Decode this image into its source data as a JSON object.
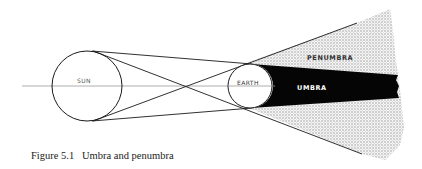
{
  "figure": {
    "caption": "Figure 5.1   Umbra and penumbra",
    "labels": {
      "sun": "SUN",
      "earth": "EARTH",
      "umbra": "UMBRA",
      "penumbra": "PENUMBRA"
    },
    "colors": {
      "line": "#1a1a1a",
      "axis": "#9a9a9a",
      "umbra": "#050505",
      "penumbra_dot": "#9c9c9c",
      "background": "#ffffff"
    },
    "geometry": {
      "sun": {
        "cx": 87,
        "cy": 86,
        "r": 35
      },
      "earth": {
        "cx": 250,
        "cy": 86,
        "r": 22
      },
      "axis": {
        "x1": 22,
        "x2": 275,
        "y": 86
      }
    }
  }
}
